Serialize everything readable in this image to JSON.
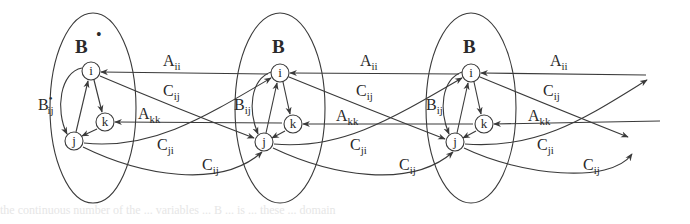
{
  "figure": {
    "type": "layered graph diagram",
    "clusters": [
      {
        "label": "B",
        "superscript": "•",
        "center": [
          93,
          108
        ],
        "rx": 43,
        "ry": 95,
        "self_edge_label": "B",
        "self_edge_sub": "ij",
        "self_edge_sup": "•",
        "nodes": {
          "i": [
            91,
            71
          ],
          "k": [
            105,
            122
          ],
          "j": [
            74,
            141
          ]
        }
      },
      {
        "label": "B",
        "superscript": "",
        "center": [
          280,
          108
        ],
        "rx": 45,
        "ry": 95,
        "self_edge_label": "B",
        "self_edge_sub": "ij",
        "self_edge_sup": "",
        "nodes": {
          "i": [
            280,
            73
          ],
          "k": [
            293,
            124
          ],
          "j": [
            264,
            142
          ]
        }
      },
      {
        "label": "B",
        "superscript": "",
        "center": [
          471,
          108
        ],
        "rx": 45,
        "ry": 95,
        "self_edge_label": "B",
        "self_edge_sub": "ij",
        "self_edge_sup": "",
        "nodes": {
          "i": [
            471,
            73
          ],
          "k": [
            484,
            124
          ],
          "j": [
            455,
            142
          ]
        }
      }
    ],
    "node_labels": {
      "i": "i",
      "k": "k",
      "j": "j"
    },
    "edge_labels": {
      "A_ii": {
        "main": "A",
        "sub": "ii"
      },
      "A_kk": {
        "main": "A",
        "sub": "kk"
      },
      "C_ij": {
        "main": "C",
        "sub": "ij"
      },
      "C_ji": {
        "main": "C",
        "sub": "ji"
      }
    },
    "inter_cluster_edges": [
      {
        "label": "A_ii",
        "from": "next.i",
        "to": "i",
        "style": "straight"
      },
      {
        "label": "C_ij",
        "from": "i",
        "to": "next.j",
        "style": "straight"
      },
      {
        "label": "A_kk",
        "from": "next.k",
        "to": "k",
        "style": "straight"
      },
      {
        "label": "C_ji",
        "from": "j",
        "to": "next.i",
        "style": "curved"
      },
      {
        "label": "C_ij",
        "from": "j",
        "to": "next.j",
        "style": "curved"
      }
    ]
  },
  "ghost_text": "the continuous number of the ... variables ... B ... is  ... these ... domain"
}
